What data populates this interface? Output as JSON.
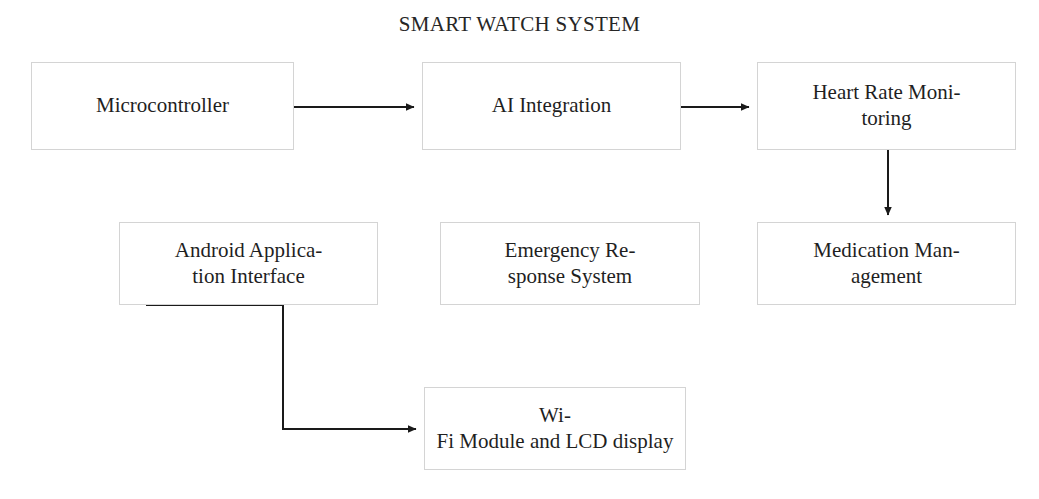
{
  "diagram": {
    "title": "SMART WATCH SYSTEM",
    "background_color": "#ffffff",
    "border_color": "#d4d4d4",
    "text_color": "#1f1f1f",
    "connector_color": "#1a1a1a",
    "nodes": [
      {
        "id": "microcontroller",
        "label": "Microcontroller",
        "x": 31,
        "y": 62,
        "w": 263,
        "h": 88
      },
      {
        "id": "ai-integration",
        "label": "AI Integration",
        "x": 422,
        "y": 62,
        "w": 259,
        "h": 88
      },
      {
        "id": "heart-rate",
        "label": "Heart Rate Moni-toring",
        "x": 757,
        "y": 62,
        "w": 259,
        "h": 88
      },
      {
        "id": "android-app",
        "label": "Android Applica-tion Interface",
        "x": 119,
        "y": 222,
        "w": 259,
        "h": 83
      },
      {
        "id": "emergency",
        "label": "Emergency Re-sponse System",
        "x": 440,
        "y": 222,
        "w": 260,
        "h": 83
      },
      {
        "id": "medication",
        "label": "Medication Man-agement",
        "x": 757,
        "y": 222,
        "w": 259,
        "h": 83
      },
      {
        "id": "wifi-lcd",
        "label": "Wi-Fi Module and LCD display",
        "x": 424,
        "y": 387,
        "w": 262,
        "h": 83
      }
    ],
    "edges": [
      {
        "id": "microcontroller-to-ai",
        "from": "microcontroller",
        "to": "ai-integration",
        "type": "straight-horizontal"
      },
      {
        "id": "ai-to-heart-rate",
        "from": "ai-integration",
        "to": "heart-rate",
        "type": "straight-horizontal"
      },
      {
        "id": "heart-rate-to-medication",
        "from": "heart-rate",
        "to": "medication",
        "type": "straight-vertical"
      },
      {
        "id": "android-app-to-wifi-lcd",
        "from": "android-app",
        "to": "wifi-lcd",
        "type": "elbow"
      }
    ]
  }
}
